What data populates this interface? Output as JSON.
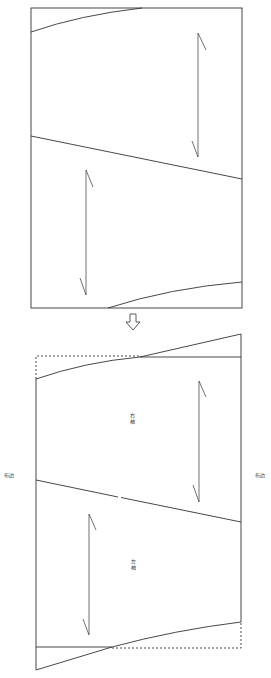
{
  "diagram": {
    "type": "sewing-pattern-layout",
    "colors": {
      "line": "#333333",
      "background": "#ffffff"
    },
    "before": {
      "pieces": [
        "top-sleeve-piece",
        "bottom-sleeve-piece"
      ],
      "grain_arrows": 2
    },
    "transition_arrow": "down-arrow-icon",
    "after": {
      "labels": {
        "right_sleeve": "右袖",
        "left_sleeve": "左袖",
        "selvedge_left": "布边",
        "selvedge_right": "布边"
      }
    }
  }
}
